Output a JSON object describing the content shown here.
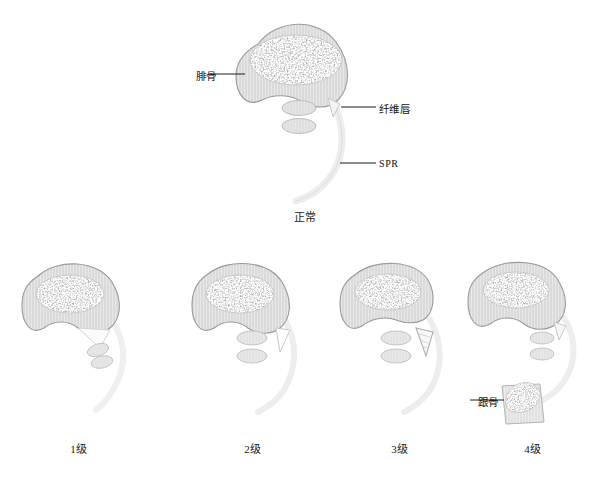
{
  "figure": {
    "title_visible": false,
    "kind": "medical-illustration",
    "colors": {
      "bone_fill": "#e6e6e6",
      "bone_hatch": "#cfcfcf",
      "bone_outline": "#9a9a9a",
      "marrow_speckle": "#3a3a3a",
      "tendon_fill": "#e2e2e2",
      "tendon_outline": "#b5b5b5",
      "spr_band": "#e9e9e9",
      "spr_outline": "#cccccc",
      "leader_line": "#1a1a1a",
      "text": "#111111",
      "background": "#ffffff"
    }
  },
  "reference": {
    "caption": "正常",
    "labels": [
      {
        "key": "fibula",
        "text": "腓骨",
        "script": "cjk"
      },
      {
        "key": "fibrous_lip",
        "text": "纤维唇",
        "script": "cjk"
      },
      {
        "key": "spr",
        "text": "SPR",
        "script": "latin"
      }
    ]
  },
  "grades": [
    {
      "id": "grade-1",
      "caption": "1级",
      "description_visible": false,
      "labels": []
    },
    {
      "id": "grade-2",
      "caption": "2级",
      "description_visible": false,
      "labels": []
    },
    {
      "id": "grade-3",
      "caption": "3级",
      "description_visible": false,
      "labels": []
    },
    {
      "id": "grade-4",
      "caption": "4级",
      "description_visible": false,
      "labels": [
        {
          "key": "calcaneus",
          "text": "跟骨",
          "script": "cjk"
        }
      ]
    }
  ]
}
